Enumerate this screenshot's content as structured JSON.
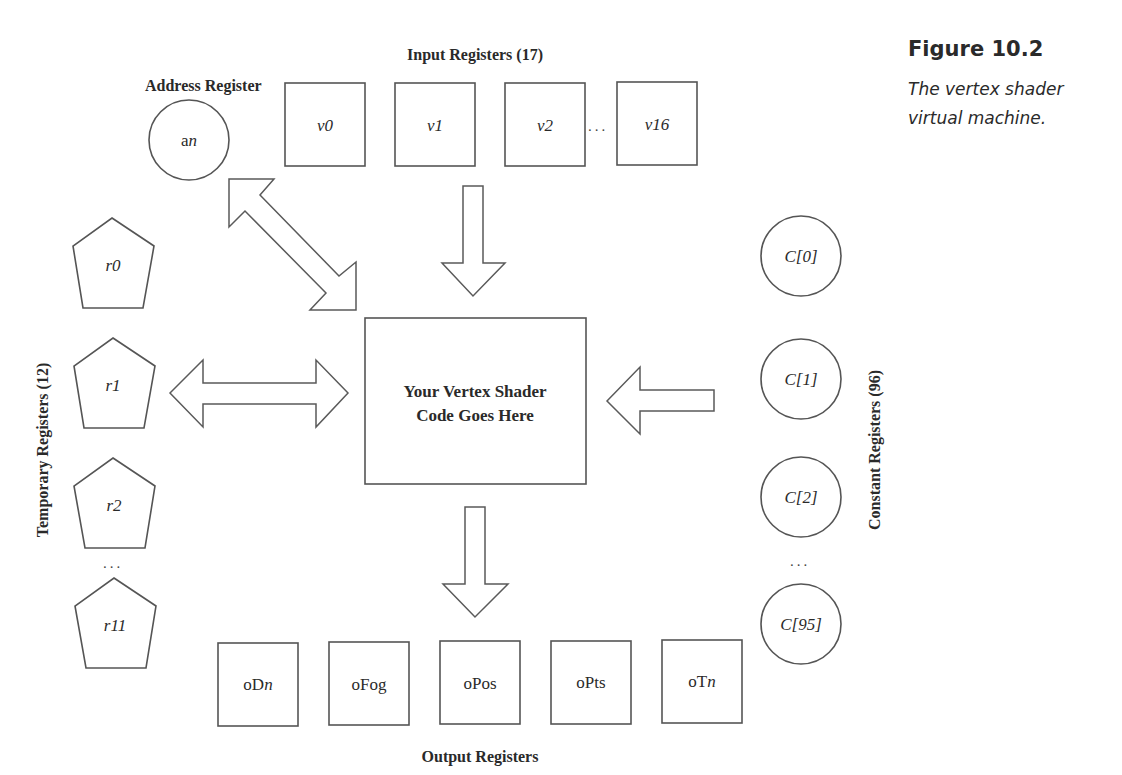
{
  "figure": {
    "number": "Figure 10.2",
    "caption": "The vertex shader virtual machine."
  },
  "address_register": {
    "label": "Address Register",
    "register": {
      "base": "a",
      "suffix": "n"
    }
  },
  "input_registers": {
    "label": "Input Registers (17)",
    "items": [
      "v0",
      "v1",
      "v2",
      "v16"
    ],
    "ellipsis": "..."
  },
  "temporary_registers": {
    "label": "Temporary Registers (12)",
    "items": [
      "r0",
      "r1",
      "r2",
      "r11"
    ],
    "ellipsis": "..."
  },
  "constant_registers": {
    "label": "Constant Registers (96)",
    "items": [
      "C[0]",
      "C[1]",
      "C[2]",
      "C[95]"
    ],
    "ellipsis": "..."
  },
  "core": {
    "line1": "Your Vertex Shader",
    "line2": "Code Goes Here"
  },
  "output_registers": {
    "label": "Output Registers",
    "items": [
      {
        "base": "oD",
        "suffix": "n"
      },
      {
        "base": "oFog",
        "suffix": ""
      },
      {
        "base": "oPos",
        "suffix": ""
      },
      {
        "base": "oPts",
        "suffix": ""
      },
      {
        "base": "oT",
        "suffix": "n"
      }
    ]
  },
  "colors": {
    "stroke": "#555555",
    "text": "#2a2a2a",
    "background": "#ffffff"
  }
}
